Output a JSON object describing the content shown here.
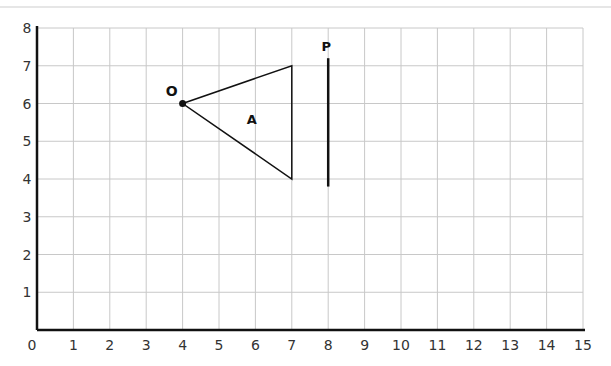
{
  "chart_data": {
    "type": "diagram",
    "grid": {
      "x_range": [
        0,
        15
      ],
      "y_range": [
        0,
        8
      ],
      "grid_on": true
    },
    "x_ticks": [
      "0",
      "1",
      "2",
      "3",
      "4",
      "5",
      "6",
      "7",
      "8",
      "9",
      "10",
      "11",
      "12",
      "13",
      "14",
      "15"
    ],
    "y_ticks": [
      "1",
      "2",
      "3",
      "4",
      "5",
      "6",
      "7",
      "8"
    ],
    "shapes": [
      {
        "name": "A",
        "type": "triangle",
        "vertices": [
          [
            4,
            6
          ],
          [
            7,
            7
          ],
          [
            7,
            4
          ]
        ]
      },
      {
        "name": "P",
        "type": "line",
        "x": 8,
        "y_from": 3.8,
        "y_to": 7.2
      },
      {
        "name": "O",
        "type": "point",
        "x": 4,
        "y": 6
      }
    ]
  },
  "labels": {
    "triangle": "A",
    "line": "P",
    "point": "O"
  },
  "colors": {
    "grid": "#c8c8c8",
    "axis": "#111111",
    "shape": "#111111"
  }
}
